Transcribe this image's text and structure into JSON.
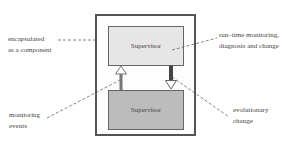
{
  "diagram": {
    "top_box": {
      "label": "Supervisor",
      "fill": "#e6e6e6"
    },
    "bottom_box": {
      "label": "Supervisor",
      "fill": "#bcbcbc"
    },
    "annotations": {
      "encapsulated": {
        "line1": "encapsulated",
        "line2": "as a component"
      },
      "runtime": {
        "line1": "run–time monitoring,",
        "line2": "diagnosis and change"
      },
      "monitoring": {
        "line1": "monitoring",
        "line2": "events"
      },
      "evolutionary": {
        "line1": "evolutionary",
        "line2": "change"
      }
    },
    "arrows": [
      {
        "name": "monitoring-events-arrow",
        "direction": "up",
        "from": "bottom_box",
        "to": "top_box"
      },
      {
        "name": "evolutionary-change-arrow",
        "direction": "down",
        "from": "top_box",
        "to": "bottom_box"
      }
    ]
  }
}
